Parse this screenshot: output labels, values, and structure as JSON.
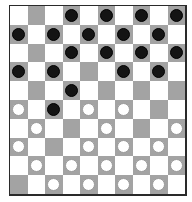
{
  "game": "draughts",
  "board": {
    "size": 10,
    "colors": {
      "light": "#ffffff",
      "dark": "#a3a3a3",
      "border": "#2a2a2a",
      "black_piece": "#141414",
      "white_piece": "#ffffff"
    },
    "rows": [
      [
        "",
        "",
        "",
        "b",
        "",
        "b",
        "",
        "b",
        "",
        "b"
      ],
      [
        "b",
        "",
        "b",
        "",
        "b",
        "",
        "b",
        "",
        "b",
        ""
      ],
      [
        "",
        "",
        "",
        "b",
        "",
        "b",
        "",
        "b",
        "",
        "b"
      ],
      [
        "b",
        "",
        "b",
        "",
        "",
        "",
        "b",
        "",
        "b",
        ""
      ],
      [
        "",
        "",
        "",
        "b",
        "",
        "",
        "",
        "",
        "",
        ""
      ],
      [
        "w",
        "",
        "b",
        "",
        "w",
        "",
        "w",
        "",
        "",
        ""
      ],
      [
        "",
        "w",
        "",
        "",
        "",
        "w",
        "",
        "",
        "",
        "w"
      ],
      [
        "w",
        "",
        "",
        "",
        "w",
        "",
        "w",
        "",
        "w",
        ""
      ],
      [
        "",
        "w",
        "",
        "w",
        "",
        "w",
        "",
        "w",
        "",
        "w"
      ],
      [
        "",
        "",
        "w",
        "",
        "w",
        "",
        "w",
        "",
        "w",
        ""
      ]
    ]
  }
}
